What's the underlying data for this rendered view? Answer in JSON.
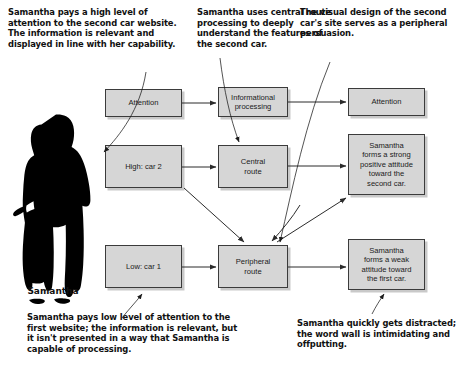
{
  "diagram": {
    "person": {
      "name_label": "Samantha",
      "figure_icon": "person-silhouette-icon"
    },
    "colors": {
      "node_fill": "#d6d6d6",
      "node_border": "#3b3b3b",
      "node_shadow": "#c9c9c9",
      "text": "#1b1b1b",
      "caption_text": "#111111",
      "connector": "#2b2b2b",
      "background": "#ffffff"
    },
    "captions": [
      {
        "id": "top-left",
        "text": "Samantha pays a high level of attention to the second car website. The information is relevant and displayed in line with her capability."
      },
      {
        "id": "top-mid",
        "text": "Samantha uses central route processing to deeply understand the features of the second car."
      },
      {
        "id": "top-right",
        "text": "The visual design of the second car's site serves as a peripheral persuasion."
      },
      {
        "id": "bottom-left",
        "text": "Samantha pays low level of attention to the first website; the information is relevant, but it isn't presented in a way that Samantha is capable of processing."
      },
      {
        "id": "bottom-right",
        "text": "Samantha quickly gets distracted; the word wall is intimidating and offputting."
      }
    ],
    "nodes": [
      {
        "id": "attention-1",
        "label": "Attention"
      },
      {
        "id": "info-proc",
        "label": "Informational\nprocessing"
      },
      {
        "id": "attention-2",
        "label": "Attention"
      },
      {
        "id": "high-car2",
        "label": "High: car 2"
      },
      {
        "id": "central",
        "label": "Central\nroute"
      },
      {
        "id": "strong",
        "label": "Samantha\nforms a strong\npositive attitude\ntoward the\nsecond car."
      },
      {
        "id": "low-car1",
        "label": "Low: car 1"
      },
      {
        "id": "peripheral",
        "label": "Peripheral\nroute"
      },
      {
        "id": "weak",
        "label": "Samantha\nforms a weak\nattitude toward\nthe first car."
      }
    ],
    "connectors": [
      {
        "from": "attention-1",
        "to": "info-proc",
        "type": "arrow"
      },
      {
        "from": "info-proc",
        "to": "attention-2",
        "type": "arrow"
      },
      {
        "from": "high-car2",
        "to": "central",
        "type": "arrow"
      },
      {
        "from": "central",
        "to": "strong",
        "type": "arrow"
      },
      {
        "from": "low-car1",
        "to": "peripheral",
        "type": "arrow"
      },
      {
        "from": "peripheral",
        "to": "weak",
        "type": "arrow"
      },
      {
        "from": "high-car2",
        "to": "peripheral",
        "type": "arrow-diagonal"
      },
      {
        "from": "peripheral",
        "to": "strong",
        "type": "arrow-diagonal"
      }
    ]
  }
}
